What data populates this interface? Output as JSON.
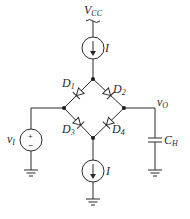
{
  "diagram": {
    "type": "diode-bridge sample-and-hold circuit",
    "colors": {
      "line": "#2a2a2a",
      "background": "#ffffff"
    },
    "supply": {
      "label_main": "V",
      "label_sub": "CC"
    },
    "current_sources": [
      {
        "id": "top",
        "label": "I",
        "direction": "down"
      },
      {
        "id": "bottom",
        "label": "I",
        "direction": "down"
      }
    ],
    "diodes": [
      {
        "id": "D1",
        "label_main": "D",
        "label_sub": "1",
        "anode": "top-node",
        "cathode": "left-node"
      },
      {
        "id": "D2",
        "label_main": "D",
        "label_sub": "2",
        "anode": "top-node",
        "cathode": "right-node"
      },
      {
        "id": "D3",
        "label_main": "D",
        "label_sub": "3",
        "anode": "left-node",
        "cathode": "bottom-node"
      },
      {
        "id": "D4",
        "label_main": "D",
        "label_sub": "4",
        "anode": "right-node",
        "cathode": "bottom-node"
      }
    ],
    "input_source": {
      "label_main": "v",
      "label_sub": "I",
      "plus": "+",
      "minus": "−"
    },
    "output": {
      "label_main": "v",
      "label_sub": "O"
    },
    "capacitor": {
      "label_main": "C",
      "label_sub": "H"
    }
  }
}
